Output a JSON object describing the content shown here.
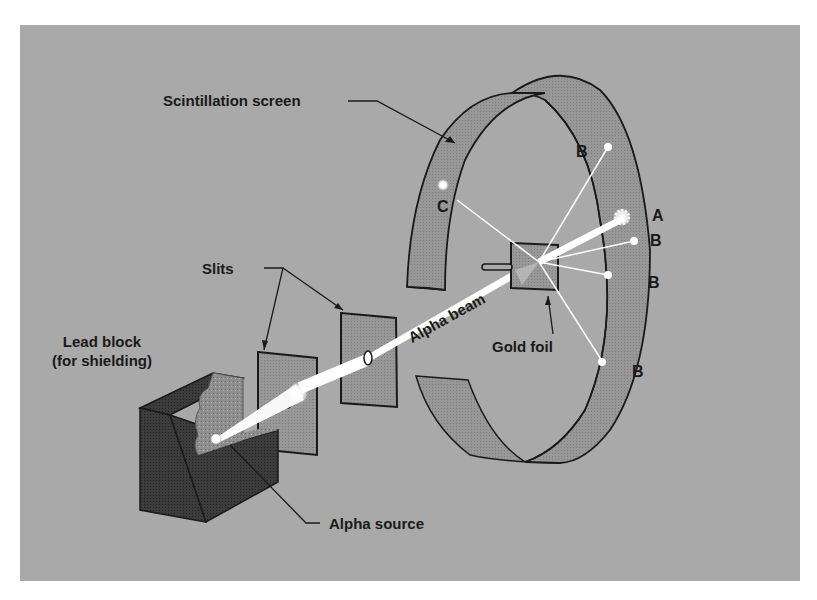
{
  "figure": {
    "colors": {
      "background_panel": "#a9a9a9",
      "screen_fill": "#959595",
      "lead_block_dark": "#3a3a3a",
      "lead_cut_face": "#8a8a8a",
      "beam": "#ffffff",
      "outline": "#1a1a1a",
      "label_text": "#1a1a1a"
    }
  },
  "labels": {
    "scintillation_screen": "Scintillation screen",
    "slits": "Slits",
    "lead_block_line1": "Lead block",
    "lead_block_line2": "(for shielding)",
    "alpha_source": "Alpha source",
    "alpha_beam": "Alpha beam",
    "gold_foil": "Gold foil"
  },
  "deflection_markers": {
    "a": "A",
    "b_top": "B",
    "b_right_1": "B",
    "b_right_2": "B",
    "b_bottom": "B",
    "c": "C"
  }
}
